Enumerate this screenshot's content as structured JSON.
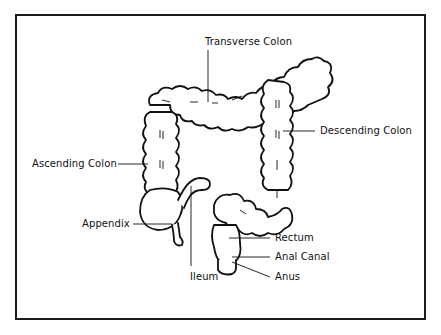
{
  "diagram": {
    "labels": {
      "transverse_colon": "Transverse Colon",
      "descending_colon": "Descending Colon",
      "ascending_colon": "Ascending Colon",
      "appendix": "Appendix",
      "rectum": "Rectum",
      "anal_canal": "Anal Canal",
      "ileum": "Ileum",
      "anus": "Anus"
    },
    "colors": {
      "line": "#111111",
      "background": "#ffffff",
      "frame": "#1a1a1a"
    }
  }
}
